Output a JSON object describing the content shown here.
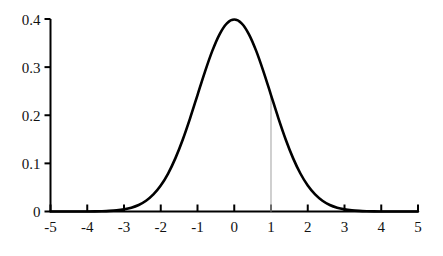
{
  "chart_data": {
    "type": "line",
    "title": "",
    "subtitle": "",
    "xlabel": "",
    "ylabel": "",
    "xlim": [
      -5,
      5
    ],
    "ylim": [
      0,
      0.4
    ],
    "grid": false,
    "legend": null,
    "x_ticks": [
      -5,
      -4,
      -3,
      -2,
      -1,
      0,
      1,
      2,
      3,
      4,
      5
    ],
    "x_tick_labels": [
      "-5",
      "-4",
      "-3",
      "-2",
      "-1",
      "0",
      "1",
      "2",
      "3",
      "4",
      "5"
    ],
    "y_ticks": [
      0,
      0.1,
      0.2,
      0.3,
      0.4
    ],
    "y_tick_labels": [
      "0",
      "0.1",
      "0.2",
      "0.3",
      "0.4"
    ],
    "series": [
      {
        "name": "standard normal pdf",
        "color": "#000000",
        "x": [
          -5,
          -4.8,
          -4.6,
          -4.4,
          -4.2,
          -4,
          -3.8,
          -3.6,
          -3.4,
          -3.2,
          -3,
          -2.8,
          -2.6,
          -2.4,
          -2.2,
          -2,
          -1.8,
          -1.6,
          -1.4,
          -1.2,
          -1,
          -0.8,
          -0.6,
          -0.4,
          -0.2,
          0,
          0.2,
          0.4,
          0.6,
          0.8,
          1,
          1.2,
          1.4,
          1.6,
          1.8,
          2,
          2.2,
          2.4,
          2.6,
          2.8,
          3,
          3.2,
          3.4,
          3.6,
          3.8,
          4,
          4.2,
          4.4,
          4.6,
          4.8,
          5
        ],
        "y": [
          1.5e-06,
          3.9e-06,
          1.02e-05,
          2.49e-05,
          5.89e-05,
          0.0001338,
          0.0002919,
          0.0006119,
          0.0012322,
          0.0023841,
          0.0044318,
          0.0079155,
          0.013583,
          0.0223945,
          0.0354746,
          0.053991,
          0.0789502,
          0.1109208,
          0.1497275,
          0.1941861,
          0.2419707,
          0.2896916,
          0.3332246,
          0.3682701,
          0.3910427,
          0.3989423,
          0.3910427,
          0.3682701,
          0.3332246,
          0.2896916,
          0.2419707,
          0.1941861,
          0.1497275,
          0.1109208,
          0.0789502,
          0.053991,
          0.0354746,
          0.0223945,
          0.013583,
          0.0079155,
          0.0044318,
          0.0023841,
          0.0012322,
          0.0006119,
          0.0002919,
          0.0001338,
          5.89e-05,
          2.49e-05,
          1.02e-05,
          3.9e-06,
          1.5e-06
        ]
      }
    ],
    "annotations": [
      {
        "name": "vertical-marker-at-x1",
        "type": "vline",
        "x": 1,
        "y_from": 0,
        "y_to": 0.242,
        "color": "#b0b0b0",
        "label": ""
      }
    ]
  },
  "axes": {
    "x_axis_color": "#000000",
    "y_axis_color": "#000000",
    "tick_color": "#000000",
    "background": "#ffffff",
    "curve_color": "#000000",
    "marker_color": "#b0b0b0"
  }
}
